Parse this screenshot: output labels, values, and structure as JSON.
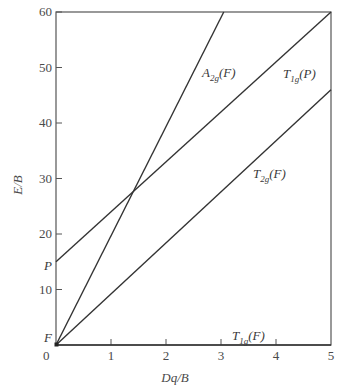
{
  "chart_data": {
    "type": "line",
    "title": "",
    "xlabel": "Dq/B",
    "ylabel": "E/B",
    "xlim": [
      0,
      5
    ],
    "ylim": [
      0,
      60
    ],
    "grid": false,
    "x_ticks": [
      "0",
      "1",
      "2",
      "3",
      "4",
      "5"
    ],
    "y_ticks": [
      "10",
      "20",
      "30",
      "40",
      "50",
      "60"
    ],
    "y_axis_markers": [
      {
        "label": "P",
        "value": 15
      },
      {
        "label": "F",
        "value": 0
      }
    ],
    "series": [
      {
        "name": "A2g(F)",
        "label_main": "A",
        "label_sub": "2g",
        "label_tail": "(F)",
        "x": [
          0,
          3.05
        ],
        "y": [
          0,
          60
        ]
      },
      {
        "name": "T1g(P)",
        "label_main": "T",
        "label_sub": "1g",
        "label_tail": "(P)",
        "x": [
          0,
          5
        ],
        "y": [
          15,
          60
        ]
      },
      {
        "name": "T2g(F)",
        "label_main": "T",
        "label_sub": "2g",
        "label_tail": "(F)",
        "x": [
          0,
          5
        ],
        "y": [
          0,
          46
        ]
      },
      {
        "name": "T1g(F)",
        "label_main": "T",
        "label_sub": "1g",
        "label_tail": "(F)",
        "x": [
          0,
          5
        ],
        "y": [
          0,
          0
        ]
      }
    ],
    "annotations": [
      {
        "text": "crossing of A2g(F) and T1g(P)",
        "x": 1.25,
        "y": 24.5
      }
    ]
  },
  "labels": {
    "x_axis_title": "Dq/B",
    "y_axis_title": "E/B",
    "zero": "0",
    "marker_P": "P",
    "marker_F": "F"
  }
}
